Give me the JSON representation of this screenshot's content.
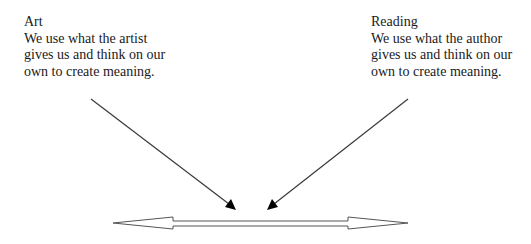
{
  "left_box": {
    "title": "Art",
    "lines": [
      "We use what the artist",
      "gives us and think on our",
      "own to create meaning."
    ]
  },
  "right_box": {
    "title": "Reading",
    "lines": [
      "We use what the author",
      "gives us and think on our",
      "own to create meaning."
    ]
  },
  "arrows": {
    "left_diagonal": {
      "from": [
        91,
        99
      ],
      "to": [
        235,
        209
      ],
      "color": "#333333"
    },
    "right_diagonal": {
      "from": [
        408,
        99
      ],
      "to": [
        268,
        209
      ],
      "color": "#333333"
    },
    "double_arrow": {
      "left_tip": [
        113,
        223
      ],
      "right_tip": [
        408,
        223
      ],
      "fill": "#ffffff",
      "stroke": "#555555"
    }
  }
}
